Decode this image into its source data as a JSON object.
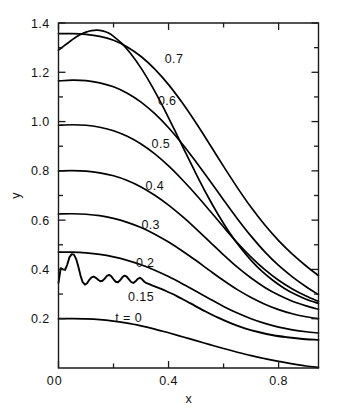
{
  "chart_data": {
    "type": "line",
    "title": "",
    "xlabel": "x",
    "ylabel": "y",
    "xlim": [
      0,
      0.945
    ],
    "ylim": [
      0,
      1.4
    ],
    "grid": false,
    "legend": "inline-curve-labels",
    "x_ticks_major": [
      0,
      0.4,
      0.8
    ],
    "x_ticks_major_labels": [
      "0",
      "0.4",
      "0.8"
    ],
    "x_ticks_minor": [
      0.2,
      0.6
    ],
    "y_ticks_major": [
      0.2,
      0.4,
      0.6,
      0.8,
      1.0,
      1.2,
      1.4
    ],
    "y_ticks_major_labels": [
      "0.2",
      "0.4",
      "0.6",
      "0.8",
      "1.0",
      "1.2",
      "1.4"
    ],
    "y_ticks_minor": [
      0.3,
      0.5,
      0.7,
      0.9,
      1.1,
      1.3
    ],
    "series": [
      {
        "name": "t = 0",
        "label": "t = 0",
        "label_x": 0.255,
        "label_y": 0.205,
        "oscillating": false,
        "points": [
          [
            0.0,
            0.2
          ],
          [
            0.05,
            0.2
          ],
          [
            0.1,
            0.199
          ],
          [
            0.15,
            0.196
          ],
          [
            0.2,
            0.19
          ],
          [
            0.25,
            0.182
          ],
          [
            0.3,
            0.171
          ],
          [
            0.35,
            0.158
          ],
          [
            0.4,
            0.143
          ],
          [
            0.45,
            0.127
          ],
          [
            0.5,
            0.111
          ],
          [
            0.55,
            0.095
          ],
          [
            0.6,
            0.079
          ],
          [
            0.65,
            0.064
          ],
          [
            0.7,
            0.05
          ],
          [
            0.75,
            0.038
          ],
          [
            0.8,
            0.027
          ],
          [
            0.85,
            0.017
          ],
          [
            0.9,
            0.008
          ],
          [
            0.945,
            0.002
          ]
        ]
      },
      {
        "name": "t = 0.15",
        "label": "0.15",
        "label_x": 0.3,
        "label_y": 0.292,
        "oscillating": true,
        "points": [
          [
            0.0,
            0.345
          ],
          [
            0.008,
            0.405
          ],
          [
            0.016,
            0.4
          ],
          [
            0.024,
            0.398
          ],
          [
            0.032,
            0.42
          ],
          [
            0.04,
            0.45
          ],
          [
            0.048,
            0.462
          ],
          [
            0.056,
            0.46
          ],
          [
            0.064,
            0.443
          ],
          [
            0.072,
            0.412
          ],
          [
            0.08,
            0.375
          ],
          [
            0.088,
            0.348
          ],
          [
            0.096,
            0.338
          ],
          [
            0.104,
            0.344
          ],
          [
            0.112,
            0.358
          ],
          [
            0.12,
            0.368
          ],
          [
            0.128,
            0.371
          ],
          [
            0.136,
            0.366
          ],
          [
            0.144,
            0.358
          ],
          [
            0.152,
            0.352
          ],
          [
            0.16,
            0.354
          ],
          [
            0.168,
            0.363
          ],
          [
            0.176,
            0.374
          ],
          [
            0.184,
            0.378
          ],
          [
            0.192,
            0.372
          ],
          [
            0.2,
            0.36
          ],
          [
            0.208,
            0.35
          ],
          [
            0.216,
            0.348
          ],
          [
            0.224,
            0.356
          ],
          [
            0.232,
            0.368
          ],
          [
            0.24,
            0.375
          ],
          [
            0.248,
            0.371
          ],
          [
            0.256,
            0.36
          ],
          [
            0.264,
            0.349
          ],
          [
            0.272,
            0.345
          ],
          [
            0.28,
            0.352
          ],
          [
            0.288,
            0.362
          ],
          [
            0.296,
            0.366
          ],
          [
            0.304,
            0.36
          ],
          [
            0.312,
            0.35
          ],
          [
            0.32,
            0.344
          ],
          [
            0.33,
            0.34
          ],
          [
            0.34,
            0.335
          ],
          [
            0.38,
            0.318
          ],
          [
            0.43,
            0.292
          ],
          [
            0.48,
            0.262
          ],
          [
            0.53,
            0.232
          ],
          [
            0.58,
            0.204
          ],
          [
            0.63,
            0.18
          ],
          [
            0.68,
            0.16
          ],
          [
            0.73,
            0.145
          ],
          [
            0.78,
            0.133
          ],
          [
            0.83,
            0.125
          ],
          [
            0.88,
            0.119
          ],
          [
            0.945,
            0.114
          ]
        ]
      },
      {
        "name": "t = 0.2",
        "label": "0.2",
        "label_x": 0.315,
        "label_y": 0.43,
        "oscillating": false,
        "points": [
          [
            0.0,
            0.47
          ],
          [
            0.05,
            0.47
          ],
          [
            0.1,
            0.467
          ],
          [
            0.15,
            0.461
          ],
          [
            0.2,
            0.451
          ],
          [
            0.25,
            0.437
          ],
          [
            0.3,
            0.419
          ],
          [
            0.35,
            0.397
          ],
          [
            0.4,
            0.371
          ],
          [
            0.45,
            0.342
          ],
          [
            0.5,
            0.311
          ],
          [
            0.55,
            0.28
          ],
          [
            0.6,
            0.25
          ],
          [
            0.65,
            0.223
          ],
          [
            0.7,
            0.2
          ],
          [
            0.75,
            0.181
          ],
          [
            0.8,
            0.166
          ],
          [
            0.85,
            0.155
          ],
          [
            0.9,
            0.147
          ],
          [
            0.945,
            0.142
          ]
        ]
      },
      {
        "name": "t = 0.3",
        "label": "0.3",
        "label_x": 0.335,
        "label_y": 0.583,
        "oscillating": false,
        "points": [
          [
            0.0,
            0.625
          ],
          [
            0.05,
            0.626
          ],
          [
            0.1,
            0.624
          ],
          [
            0.15,
            0.618
          ],
          [
            0.2,
            0.607
          ],
          [
            0.25,
            0.591
          ],
          [
            0.3,
            0.57
          ],
          [
            0.35,
            0.543
          ],
          [
            0.4,
            0.511
          ],
          [
            0.45,
            0.475
          ],
          [
            0.5,
            0.436
          ],
          [
            0.55,
            0.395
          ],
          [
            0.6,
            0.355
          ],
          [
            0.65,
            0.318
          ],
          [
            0.7,
            0.286
          ],
          [
            0.75,
            0.259
          ],
          [
            0.8,
            0.237
          ],
          [
            0.85,
            0.22
          ],
          [
            0.9,
            0.208
          ],
          [
            0.945,
            0.2
          ]
        ]
      },
      {
        "name": "t = 0.4",
        "label": "0.4",
        "label_x": 0.35,
        "label_y": 0.742,
        "oscillating": false,
        "points": [
          [
            0.0,
            0.8
          ],
          [
            0.05,
            0.801
          ],
          [
            0.1,
            0.799
          ],
          [
            0.15,
            0.792
          ],
          [
            0.2,
            0.78
          ],
          [
            0.25,
            0.761
          ],
          [
            0.3,
            0.735
          ],
          [
            0.35,
            0.701
          ],
          [
            0.4,
            0.661
          ],
          [
            0.45,
            0.615
          ],
          [
            0.5,
            0.565
          ],
          [
            0.55,
            0.512
          ],
          [
            0.6,
            0.459
          ],
          [
            0.65,
            0.409
          ],
          [
            0.7,
            0.365
          ],
          [
            0.75,
            0.327
          ],
          [
            0.8,
            0.296
          ],
          [
            0.85,
            0.271
          ],
          [
            0.9,
            0.252
          ],
          [
            0.945,
            0.238
          ]
        ]
      },
      {
        "name": "t = 0.5",
        "label": "0.5",
        "label_x": 0.372,
        "label_y": 0.912,
        "oscillating": false,
        "points": [
          [
            0.0,
            0.985
          ],
          [
            0.05,
            0.987
          ],
          [
            0.1,
            0.985
          ],
          [
            0.15,
            0.977
          ],
          [
            0.2,
            0.963
          ],
          [
            0.25,
            0.94
          ],
          [
            0.3,
            0.909
          ],
          [
            0.35,
            0.869
          ],
          [
            0.4,
            0.82
          ],
          [
            0.45,
            0.764
          ],
          [
            0.5,
            0.703
          ],
          [
            0.55,
            0.638
          ],
          [
            0.6,
            0.572
          ],
          [
            0.65,
            0.508
          ],
          [
            0.7,
            0.45
          ],
          [
            0.75,
            0.399
          ],
          [
            0.8,
            0.356
          ],
          [
            0.85,
            0.321
          ],
          [
            0.9,
            0.292
          ],
          [
            0.945,
            0.27
          ]
        ]
      },
      {
        "name": "t = 0.6",
        "label": "0.6",
        "label_x": 0.395,
        "label_y": 1.085,
        "oscillating": false,
        "points": [
          [
            0.0,
            1.165
          ],
          [
            0.05,
            1.168
          ],
          [
            0.1,
            1.166
          ],
          [
            0.15,
            1.157
          ],
          [
            0.2,
            1.141
          ],
          [
            0.25,
            1.115
          ],
          [
            0.3,
            1.079
          ],
          [
            0.35,
            1.032
          ],
          [
            0.4,
            0.975
          ],
          [
            0.45,
            0.909
          ],
          [
            0.5,
            0.836
          ],
          [
            0.55,
            0.76
          ],
          [
            0.6,
            0.682
          ],
          [
            0.65,
            0.606
          ],
          [
            0.7,
            0.535
          ],
          [
            0.75,
            0.471
          ],
          [
            0.8,
            0.416
          ],
          [
            0.85,
            0.37
          ],
          [
            0.9,
            0.33
          ],
          [
            0.945,
            0.298
          ]
        ]
      },
      {
        "name": "t = 0.7",
        "label": "0.7",
        "label_x": 0.42,
        "label_y": 1.255,
        "oscillating": false,
        "points": [
          [
            0.0,
            1.29
          ],
          [
            0.02,
            1.307
          ],
          [
            0.04,
            1.324
          ],
          [
            0.06,
            1.34
          ],
          [
            0.08,
            1.353
          ],
          [
            0.1,
            1.363
          ],
          [
            0.12,
            1.369
          ],
          [
            0.14,
            1.371
          ],
          [
            0.16,
            1.368
          ],
          [
            0.18,
            1.36
          ],
          [
            0.2,
            1.346
          ],
          [
            0.23,
            1.317
          ],
          [
            0.26,
            1.279
          ],
          [
            0.3,
            1.217
          ],
          [
            0.34,
            1.143
          ],
          [
            0.38,
            1.06
          ],
          [
            0.42,
            0.97
          ],
          [
            0.46,
            0.878
          ],
          [
            0.5,
            0.788
          ],
          [
            0.54,
            0.702
          ],
          [
            0.58,
            0.623
          ],
          [
            0.62,
            0.552
          ],
          [
            0.66,
            0.49
          ],
          [
            0.7,
            0.437
          ],
          [
            0.74,
            0.392
          ],
          [
            0.78,
            0.355
          ],
          [
            0.82,
            0.324
          ],
          [
            0.86,
            0.299
          ],
          [
            0.9,
            0.279
          ],
          [
            0.945,
            0.262
          ]
        ]
      },
      {
        "name": "upper-envelope",
        "label": "",
        "label_x": null,
        "label_y": null,
        "oscillating": false,
        "points": [
          [
            0.0,
            1.357
          ],
          [
            0.05,
            1.357
          ],
          [
            0.1,
            1.354
          ],
          [
            0.15,
            1.346
          ],
          [
            0.2,
            1.33
          ],
          [
            0.25,
            1.303
          ],
          [
            0.3,
            1.264
          ],
          [
            0.35,
            1.213
          ],
          [
            0.4,
            1.15
          ],
          [
            0.45,
            1.076
          ],
          [
            0.5,
            0.994
          ],
          [
            0.55,
            0.907
          ],
          [
            0.6,
            0.818
          ],
          [
            0.65,
            0.732
          ],
          [
            0.7,
            0.652
          ],
          [
            0.75,
            0.58
          ],
          [
            0.8,
            0.517
          ],
          [
            0.85,
            0.462
          ],
          [
            0.9,
            0.414
          ],
          [
            0.945,
            0.375
          ]
        ]
      }
    ]
  }
}
